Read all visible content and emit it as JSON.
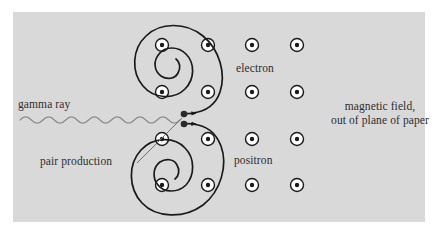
{
  "figure": {
    "panel": {
      "background_color": "#d9d9d9",
      "x": 13,
      "y": 12,
      "width": 412,
      "height": 210
    },
    "page_background_color": "#ffffff"
  },
  "labels": {
    "gamma_ray": "gamma ray",
    "electron": "electron",
    "positron": "positron",
    "pair_production": "pair production",
    "magnetic_field_line1": "magnetic field,",
    "magnetic_field_line2": "out of plane of paper"
  },
  "colors": {
    "text": "#2e2e2e",
    "track": "#1a1a1a",
    "gamma_wave": "#8c8c8c",
    "leader_line": "#6f6f6f",
    "field_dot_fill": "#ffffff",
    "field_dot_ring": "#1a1a1a",
    "field_dot_center": "#1a1a1a"
  },
  "magnetic_field": {
    "symbol": "dot-in-circle",
    "direction": "out of plane of paper",
    "columns_x": [
      162,
      208,
      252,
      297
    ],
    "rows_y": [
      45,
      92,
      139,
      185
    ],
    "dot_outer_radius": 6.5,
    "dot_center_radius": 2.2,
    "count": 16
  },
  "gamma_ray_wave": {
    "x_start": 20,
    "x_end": 180,
    "y": 120,
    "amplitude": 3.2,
    "cycles": 7,
    "stroke_width": 1.2
  },
  "vertex": {
    "label": "pair production",
    "electron_vertex": {
      "x": 184,
      "y": 114,
      "radius": 3.2
    },
    "positron_vertex": {
      "x": 184,
      "y": 124,
      "radius": 3.2
    },
    "leader_line": {
      "x1": 137,
      "y1": 163,
      "x2": 182,
      "y2": 118
    }
  },
  "tracks": [
    {
      "name": "electron",
      "charge": "negative",
      "center_x": 182,
      "center_y": 58,
      "winding": "counterclockwise-inward",
      "arrow_direction": "right",
      "stroke_width": 1.6
    },
    {
      "name": "positron",
      "charge": "positive",
      "center_x": 178,
      "center_y": 172,
      "winding": "clockwise-inward",
      "arrow_direction": "right",
      "stroke_width": 1.6
    }
  ]
}
